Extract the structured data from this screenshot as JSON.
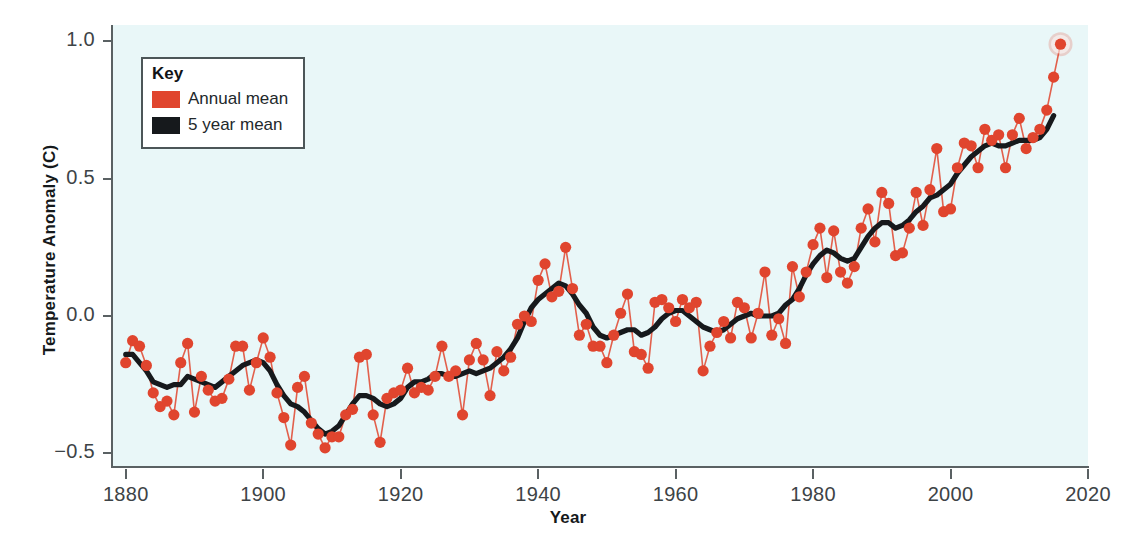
{
  "chart_data": {
    "type": "line",
    "title": "",
    "xlabel": "Year",
    "ylabel": "Temperature Anomaly (C)",
    "xlim": [
      1878,
      2020
    ],
    "ylim": [
      -0.55,
      1.06
    ],
    "xticks": [
      1880,
      1900,
      1920,
      1940,
      1960,
      1980,
      2000,
      2020
    ],
    "xtick_labels": [
      "1880",
      "1900",
      "1920",
      "1940",
      "1960",
      "1980",
      "2000",
      "2020"
    ],
    "yticks": [
      -0.5,
      0.0,
      0.5,
      1.0
    ],
    "ytick_labels": [
      "−0.5",
      "0.0",
      "0.5",
      "1.0"
    ],
    "grid": false,
    "plot_background": "#e9f7f8",
    "figure_background": "#ffffff",
    "axis_color": "#5a6163",
    "highlight_last_point": true,
    "legend_position": "upper-left",
    "series": [
      {
        "name": "Annual mean",
        "color": "#e0452e",
        "marker": "circle",
        "x": [
          1880,
          1881,
          1882,
          1883,
          1884,
          1885,
          1886,
          1887,
          1888,
          1889,
          1890,
          1891,
          1892,
          1893,
          1894,
          1895,
          1896,
          1897,
          1898,
          1899,
          1900,
          1901,
          1902,
          1903,
          1904,
          1905,
          1906,
          1907,
          1908,
          1909,
          1910,
          1911,
          1912,
          1913,
          1914,
          1915,
          1916,
          1917,
          1918,
          1919,
          1920,
          1921,
          1922,
          1923,
          1924,
          1925,
          1926,
          1927,
          1928,
          1929,
          1930,
          1931,
          1932,
          1933,
          1934,
          1935,
          1936,
          1937,
          1938,
          1939,
          1940,
          1941,
          1942,
          1943,
          1944,
          1945,
          1946,
          1947,
          1948,
          1949,
          1950,
          1951,
          1952,
          1953,
          1954,
          1955,
          1956,
          1957,
          1958,
          1959,
          1960,
          1961,
          1962,
          1963,
          1964,
          1965,
          1966,
          1967,
          1968,
          1969,
          1970,
          1971,
          1972,
          1973,
          1974,
          1975,
          1976,
          1977,
          1978,
          1979,
          1980,
          1981,
          1982,
          1983,
          1984,
          1985,
          1986,
          1987,
          1988,
          1989,
          1990,
          1991,
          1992,
          1993,
          1994,
          1995,
          1996,
          1997,
          1998,
          1999,
          2000,
          2001,
          2002,
          2003,
          2004,
          2005,
          2006,
          2007,
          2008,
          2009,
          2010,
          2011,
          2012,
          2013,
          2014,
          2015,
          2016
        ],
        "values": [
          -0.17,
          -0.09,
          -0.11,
          -0.18,
          -0.28,
          -0.33,
          -0.31,
          -0.36,
          -0.17,
          -0.1,
          -0.35,
          -0.22,
          -0.27,
          -0.31,
          -0.3,
          -0.23,
          -0.11,
          -0.11,
          -0.27,
          -0.17,
          -0.08,
          -0.15,
          -0.28,
          -0.37,
          -0.47,
          -0.26,
          -0.22,
          -0.39,
          -0.43,
          -0.48,
          -0.44,
          -0.44,
          -0.36,
          -0.34,
          -0.15,
          -0.14,
          -0.36,
          -0.46,
          -0.3,
          -0.28,
          -0.27,
          -0.19,
          -0.28,
          -0.26,
          -0.27,
          -0.22,
          -0.11,
          -0.22,
          -0.2,
          -0.36,
          -0.16,
          -0.1,
          -0.16,
          -0.29,
          -0.13,
          -0.2,
          -0.15,
          -0.03,
          0.0,
          -0.02,
          0.13,
          0.19,
          0.07,
          0.09,
          0.25,
          0.1,
          -0.07,
          -0.03,
          -0.11,
          -0.11,
          -0.17,
          -0.07,
          0.01,
          0.08,
          -0.13,
          -0.14,
          -0.19,
          0.05,
          0.06,
          0.03,
          -0.02,
          0.06,
          0.03,
          0.05,
          -0.2,
          -0.11,
          -0.06,
          -0.02,
          -0.08,
          0.05,
          0.03,
          -0.08,
          0.01,
          0.16,
          -0.07,
          -0.01,
          -0.1,
          0.18,
          0.07,
          0.16,
          0.26,
          0.32,
          0.14,
          0.31,
          0.16,
          0.12,
          0.18,
          0.32,
          0.39,
          0.27,
          0.45,
          0.41,
          0.22,
          0.23,
          0.32,
          0.45,
          0.33,
          0.46,
          0.61,
          0.38,
          0.39,
          0.54,
          0.63,
          0.62,
          0.54,
          0.68,
          0.64,
          0.66,
          0.54,
          0.66,
          0.72,
          0.61,
          0.65,
          0.68,
          0.75,
          0.87,
          0.99
        ]
      },
      {
        "name": "5 year mean",
        "color": "#16191c",
        "marker": "none",
        "x": [
          1880,
          1881,
          1882,
          1883,
          1884,
          1885,
          1886,
          1887,
          1888,
          1889,
          1890,
          1891,
          1892,
          1893,
          1894,
          1895,
          1896,
          1897,
          1898,
          1899,
          1900,
          1901,
          1902,
          1903,
          1904,
          1905,
          1906,
          1907,
          1908,
          1909,
          1910,
          1911,
          1912,
          1913,
          1914,
          1915,
          1916,
          1917,
          1918,
          1919,
          1920,
          1921,
          1922,
          1923,
          1924,
          1925,
          1926,
          1927,
          1928,
          1929,
          1930,
          1931,
          1932,
          1933,
          1934,
          1935,
          1936,
          1937,
          1938,
          1939,
          1940,
          1941,
          1942,
          1943,
          1944,
          1945,
          1946,
          1947,
          1948,
          1949,
          1950,
          1951,
          1952,
          1953,
          1954,
          1955,
          1956,
          1957,
          1958,
          1959,
          1960,
          1961,
          1962,
          1963,
          1964,
          1965,
          1966,
          1967,
          1968,
          1969,
          1970,
          1971,
          1972,
          1973,
          1974,
          1975,
          1976,
          1977,
          1978,
          1979,
          1980,
          1981,
          1982,
          1983,
          1984,
          1985,
          1986,
          1987,
          1988,
          1989,
          1990,
          1991,
          1992,
          1993,
          1994,
          1995,
          1996,
          1997,
          1998,
          1999,
          2000,
          2001,
          2002,
          2003,
          2004,
          2005,
          2006,
          2007,
          2008,
          2009,
          2010,
          2011,
          2012,
          2013,
          2014,
          2015
        ],
        "values": [
          -0.14,
          -0.14,
          -0.17,
          -0.2,
          -0.24,
          -0.25,
          -0.26,
          -0.25,
          -0.25,
          -0.22,
          -0.23,
          -0.24,
          -0.25,
          -0.26,
          -0.24,
          -0.22,
          -0.2,
          -0.18,
          -0.17,
          -0.16,
          -0.17,
          -0.2,
          -0.25,
          -0.29,
          -0.32,
          -0.33,
          -0.35,
          -0.38,
          -0.41,
          -0.43,
          -0.42,
          -0.4,
          -0.36,
          -0.32,
          -0.29,
          -0.29,
          -0.3,
          -0.32,
          -0.33,
          -0.32,
          -0.3,
          -0.26,
          -0.24,
          -0.24,
          -0.23,
          -0.21,
          -0.21,
          -0.22,
          -0.22,
          -0.21,
          -0.2,
          -0.21,
          -0.2,
          -0.19,
          -0.17,
          -0.15,
          -0.12,
          -0.08,
          -0.02,
          0.03,
          0.06,
          0.08,
          0.1,
          0.12,
          0.11,
          0.08,
          0.04,
          0.01,
          -0.04,
          -0.07,
          -0.08,
          -0.07,
          -0.06,
          -0.05,
          -0.05,
          -0.07,
          -0.06,
          -0.04,
          -0.01,
          0.01,
          0.02,
          0.02,
          0.0,
          -0.02,
          -0.04,
          -0.05,
          -0.06,
          -0.05,
          -0.03,
          -0.01,
          0.0,
          0.01,
          0.0,
          0.0,
          0.0,
          0.01,
          0.04,
          0.06,
          0.1,
          0.15,
          0.19,
          0.22,
          0.24,
          0.23,
          0.21,
          0.2,
          0.21,
          0.25,
          0.29,
          0.32,
          0.34,
          0.34,
          0.32,
          0.33,
          0.35,
          0.38,
          0.4,
          0.43,
          0.44,
          0.46,
          0.48,
          0.52,
          0.55,
          0.58,
          0.6,
          0.62,
          0.63,
          0.62,
          0.62,
          0.63,
          0.64,
          0.64,
          0.64,
          0.65,
          0.68,
          0.73
        ]
      }
    ]
  },
  "legend": {
    "title": "Key",
    "entries": [
      {
        "label": "Annual mean",
        "color": "#e0452e"
      },
      {
        "label": "5 year mean",
        "color": "#16191c"
      }
    ]
  }
}
